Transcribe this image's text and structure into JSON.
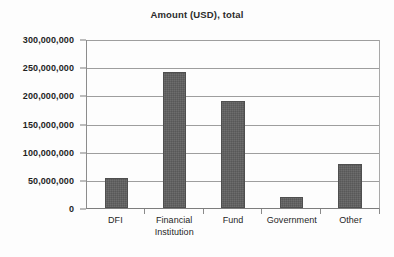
{
  "chart_data": {
    "type": "bar",
    "title": "Amount (USD), total",
    "xlabel": "",
    "ylabel": "",
    "categories": [
      "DFI",
      "Financial Institution",
      "Fund",
      "Government",
      "Other"
    ],
    "category_lines": [
      [
        "DFI"
      ],
      [
        "Financial",
        "Institution"
      ],
      [
        "Fund"
      ],
      [
        "Government"
      ],
      [
        "Other"
      ]
    ],
    "values": [
      53000000,
      241000000,
      190000000,
      20000000,
      78000000
    ],
    "ylim": [
      0,
      300000000
    ],
    "yticks": [
      0,
      50000000,
      100000000,
      150000000,
      200000000,
      250000000,
      300000000
    ],
    "ytick_labels": [
      "0",
      "50,000,000",
      "100,000,000",
      "150,000,000",
      "200,000,000",
      "250,000,000",
      "300,000,000"
    ],
    "grid": true,
    "legend": null,
    "bar_color": "#5e5e5e",
    "gridline_color": "#9e9e9e",
    "axis_color": "#7d7d7d",
    "background_color": "#fdfdfd"
  }
}
